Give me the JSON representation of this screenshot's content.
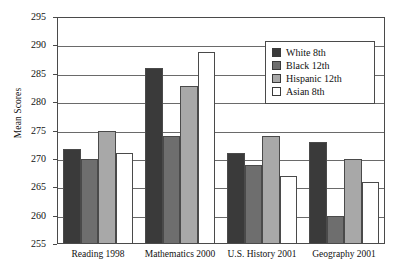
{
  "chart_data": {
    "type": "bar",
    "title": "",
    "subtitle": "",
    "xlabel": "",
    "ylabel": "Mean Scores",
    "ylim": [
      255,
      295
    ],
    "ytick_labels": [
      "295",
      "290",
      "285",
      "280",
      "275",
      "270",
      "265",
      "260",
      "255"
    ],
    "ytick_values": [
      295,
      290,
      285,
      280,
      275,
      270,
      265,
      260,
      255
    ],
    "grid": "horizontal",
    "legend_position": "top-right-inside",
    "categories": [
      "Reading 1998",
      "Mathematics 2000",
      "U.S. History 2001",
      "Geography 2001"
    ],
    "series": [
      {
        "name": "White 8th",
        "color": "#3a3a3a",
        "values": [
          271.8,
          286.1,
          271.0,
          273.0
        ]
      },
      {
        "name": "Black 12th",
        "color": "#6e6e6e",
        "values": [
          270.0,
          274.1,
          269.0,
          260.0
        ]
      },
      {
        "name": "Hispanic 12th",
        "color": "#a8a8a8",
        "values": [
          275.0,
          282.9,
          274.0,
          270.0
        ]
      },
      {
        "name": "Asian 8th",
        "color": "#ffffff",
        "values": [
          271.0,
          288.9,
          267.0,
          266.0
        ]
      }
    ],
    "colors": {
      "axis": "#4a4a4a",
      "gridline": "#6a6a6a",
      "bar_outline": "#4a4a4a",
      "text": "#111111",
      "background": "#ffffff"
    }
  }
}
